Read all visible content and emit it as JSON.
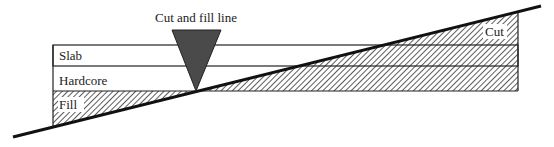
{
  "diagram": {
    "title_label": "Cut and fill line",
    "layers": [
      {
        "id": "slab",
        "label": "Slab"
      },
      {
        "id": "hardcore",
        "label": "Hardcore"
      },
      {
        "id": "fill",
        "label": "Fill"
      }
    ],
    "cut_label": "Cut",
    "colors": {
      "line": "#111111",
      "marker": "#4a4a4a",
      "hatch": "#333333",
      "background": "#ffffff"
    }
  }
}
